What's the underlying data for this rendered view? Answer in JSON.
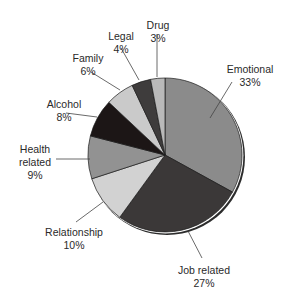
{
  "chart_data": {
    "type": "pie",
    "title": "",
    "start_angle_deg": 0,
    "direction": "clockwise",
    "slices": [
      {
        "label": "Emotional",
        "value": 33,
        "pct": "33%",
        "color": "#8b8b8b"
      },
      {
        "label": "Job related",
        "value": 27,
        "pct": "27%",
        "color": "#3b3838"
      },
      {
        "label": "Relationship",
        "value": 10,
        "pct": "10%",
        "color": "#d2d2d2"
      },
      {
        "label": "Health related",
        "value": 9,
        "pct": "9%",
        "color": "#929292"
      },
      {
        "label": "Alcohol",
        "value": 8,
        "pct": "8%",
        "color": "#1c1616"
      },
      {
        "label": "Family",
        "value": 6,
        "pct": "6%",
        "color": "#cacaca"
      },
      {
        "label": "Legal",
        "value": 4,
        "pct": "4%",
        "color": "#3e3c3c"
      },
      {
        "label": "Drug",
        "value": 3,
        "pct": "3%",
        "color": "#b9b9b9"
      }
    ],
    "labels_layout": [
      {
        "lines": [
          "Emotional",
          "33%"
        ],
        "x": 250,
        "y": 63,
        "lead": [
          [
            232,
            82
          ],
          [
            210,
            118
          ]
        ]
      },
      {
        "lines": [
          "Job related",
          "27%"
        ],
        "x": 204,
        "y": 264,
        "lead": [
          [
            202,
            258
          ],
          [
            188,
            231
          ]
        ]
      },
      {
        "lines": [
          "Relationship",
          "10%"
        ],
        "x": 74,
        "y": 226,
        "lead": [
          [
            76,
            222
          ],
          [
            103,
            202
          ]
        ]
      },
      {
        "lines": [
          "Health",
          "related",
          "9%"
        ],
        "x": 35,
        "y": 143,
        "lead": [
          [
            56,
            159
          ],
          [
            90,
            159
          ]
        ]
      },
      {
        "lines": [
          "Alcohol",
          "8%"
        ],
        "x": 64,
        "y": 98,
        "lead": [
          [
            66,
            113
          ],
          [
            97,
            117
          ]
        ]
      },
      {
        "lines": [
          "Family",
          "6%"
        ],
        "x": 88,
        "y": 52,
        "lead": [
          [
            91,
            72
          ],
          [
            120,
            90
          ]
        ]
      },
      {
        "lines": [
          "Legal",
          "4%"
        ],
        "x": 121,
        "y": 30,
        "lead": [
          [
            121,
            48
          ],
          [
            139,
            80
          ]
        ]
      },
      {
        "lines": [
          "Drug",
          "3%"
        ],
        "x": 158,
        "y": 19,
        "lead": [
          [
            157,
            34
          ],
          [
            157,
            77
          ]
        ]
      }
    ],
    "center": [
      165,
      155
    ],
    "radius": 77,
    "legend": "none",
    "grid": false
  }
}
